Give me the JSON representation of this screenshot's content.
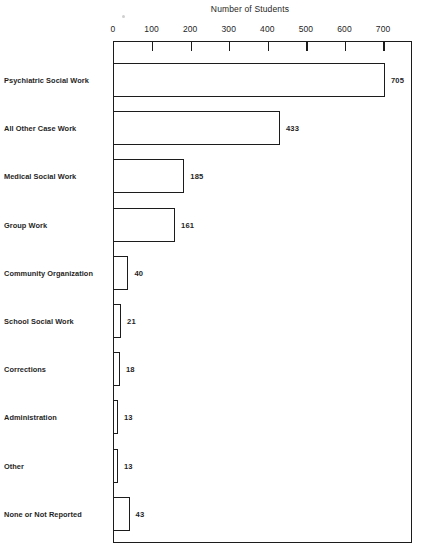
{
  "chart_data": {
    "type": "bar",
    "orientation": "horizontal",
    "title": "Number of Students",
    "xlabel": "Number of Students",
    "ylabel": "",
    "xlim": [
      0,
      775
    ],
    "xticks": [
      0,
      100,
      200,
      300,
      400,
      500,
      600,
      700
    ],
    "xticklabels": [
      "0",
      "100",
      "200",
      "300",
      "400",
      "500",
      "600",
      "700"
    ],
    "grid": false,
    "legend": null,
    "categories": [
      "Psychiatric Social Work",
      "All Other Case Work",
      "Medical Social Work",
      "Group Work",
      "Community Organization",
      "School Social Work",
      "Corrections",
      "Administration",
      "Other",
      "None or Not Reported"
    ],
    "values": [
      705,
      433,
      185,
      161,
      40,
      21,
      18,
      13,
      13,
      43
    ],
    "value_labels": [
      "705",
      "433",
      "185",
      "161",
      "40",
      "21",
      "18",
      "13",
      "13",
      "43"
    ],
    "bar_fill": "#ffffff",
    "bar_edge": "#1c1c1c",
    "axis_color": "#1c1c1c",
    "background": "#ffffff"
  }
}
